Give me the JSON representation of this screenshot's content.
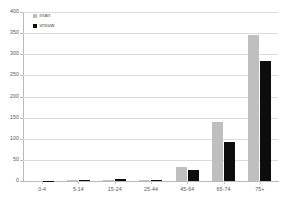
{
  "chart_data": {
    "type": "bar",
    "title": "",
    "subtitle": "",
    "xlabel": "",
    "ylabel": "",
    "categories": [
      "0-4",
      "5-14",
      "15-24",
      "25-44",
      "45-64",
      "65-74",
      "75+"
    ],
    "series": [
      {
        "name": "man",
        "color": "#bfbfbf",
        "values": [
          1,
          2,
          2,
          3,
          33,
          140,
          345
        ]
      },
      {
        "name": "vrouw",
        "color": "#0d0d0d",
        "values": [
          1,
          2,
          4,
          3,
          26,
          92,
          283
        ]
      }
    ],
    "ylim": [
      0,
      400
    ],
    "yticks": [
      0,
      50,
      100,
      150,
      200,
      250,
      300,
      350,
      400
    ],
    "ytick_labels": [
      "0",
      "50",
      "100",
      "150",
      "200",
      "250",
      "300",
      "350",
      "400"
    ],
    "grid": true,
    "grid_axis": "y",
    "legend_position": "top-left",
    "legend": [
      "man",
      "vrouw"
    ]
  },
  "legend": {
    "entries": [
      {
        "label": "man",
        "swatch": "man-swatch-icon"
      },
      {
        "label": "vrouw",
        "swatch": "vrouw-swatch-icon"
      }
    ]
  },
  "colors": {
    "man": "#bfbfbf",
    "vrouw": "#0d0d0d",
    "grid": "#dcdcdc",
    "axis": "#b9b9b9",
    "text": "#565656",
    "background": "#ffffff"
  }
}
